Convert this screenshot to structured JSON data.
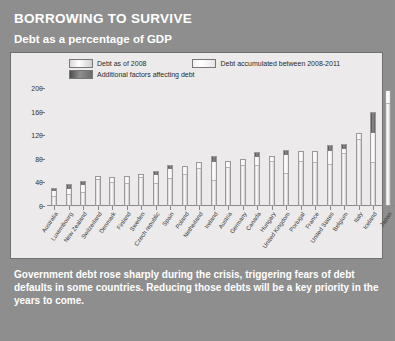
{
  "header": {
    "title": "BORROWING TO SURVIVE",
    "subtitle": "Debt as a percentage of GDP"
  },
  "caption": "Government debt rose sharply during the crisis, triggering fears of debt defaults in some countries. Reducing those debts will be a key priority in the years to come.",
  "colors": {
    "panel_background": "#8e8e8e",
    "chart_background": "#eceaea",
    "debt_2008": "#dcdcdc",
    "debt_accumulated": "#f2f2f2",
    "additional_factors": "#6a6a6a",
    "title_text": "#ffffff"
  },
  "chart_data": {
    "type": "bar",
    "title": "Debt as a percentage of GDP",
    "xlabel": "",
    "ylabel": "",
    "ylim": [
      0,
      200
    ],
    "yticks": [
      0,
      40,
      80,
      120,
      160,
      200
    ],
    "grid": false,
    "legend_position": "top",
    "stacked": true,
    "categories": [
      "Australia",
      "Luxembourg",
      "New Zealand",
      "Switzerland",
      "Denmark",
      "Finland",
      "Sweden",
      "Czech republic",
      "Spain",
      "Poland",
      "Netherland",
      "Ireland",
      "Austria",
      "Germany",
      "Canada",
      "Hungary",
      "United Kingdom",
      "Portugal",
      "France",
      "United States",
      "Belgium",
      "Italy",
      "Iceland",
      "Japan"
    ],
    "series": [
      {
        "name": "Debt as of 2008",
        "values": [
          17,
          20,
          25,
          47,
          42,
          40,
          50,
          40,
          48,
          55,
          65,
          45,
          68,
          70,
          71,
          77,
          57,
          78,
          75,
          72,
          93,
          115,
          75,
          175
        ]
      },
      {
        "name": "Debt accumulated between 2008-2011",
        "values": [
          11,
          12,
          14,
          4,
          7,
          11,
          5,
          15,
          18,
          12,
          9,
          33,
          9,
          10,
          15,
          8,
          32,
          15,
          18,
          25,
          7,
          8,
          50,
          22
        ]
      },
      {
        "name": "Additional factors affecting debt",
        "values": [
          3,
          6,
          4,
          0,
          0,
          0,
          0,
          5,
          4,
          0,
          0,
          7,
          0,
          0,
          6,
          0,
          6,
          0,
          0,
          6,
          5,
          0,
          35,
          0
        ]
      }
    ],
    "totals": [
      31,
      38,
      43,
      51,
      49,
      51,
      55,
      60,
      70,
      67,
      74,
      85,
      77,
      80,
      92,
      85,
      95,
      93,
      93,
      103,
      105,
      123,
      160,
      197
    ]
  },
  "legend": {
    "items": [
      {
        "label": "Debt as of 2008",
        "swatch": "debt-2008-swatch"
      },
      {
        "label": "Debt accumulated between 2008-2011",
        "swatch": "debt-accumulated-swatch"
      },
      {
        "label": "Additional factors affecting debt",
        "swatch": "additional-factors-swatch"
      }
    ]
  }
}
